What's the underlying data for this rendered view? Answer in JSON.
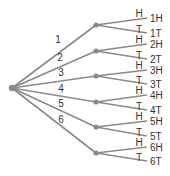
{
  "diagram": {
    "type": "tree",
    "colors": {
      "edge": "#8a8a8a",
      "text": "#333333"
    },
    "root": {
      "x": 12,
      "y": 88
    },
    "branches": [
      {
        "label": "1",
        "node": {
          "x": 96,
          "y": 25
        },
        "label_pos": {
          "x": 58,
          "y": 43
        },
        "leaves": [
          {
            "edge": "H",
            "outcome": "1H",
            "y": 18
          },
          {
            "edge": "T",
            "outcome": "1T",
            "y": 33
          }
        ]
      },
      {
        "label": "2",
        "node": {
          "x": 96,
          "y": 51
        },
        "label_pos": {
          "x": 60,
          "y": 61
        },
        "leaves": [
          {
            "edge": "H",
            "outcome": "2H",
            "y": 44
          },
          {
            "edge": "T",
            "outcome": "2T",
            "y": 59
          }
        ]
      },
      {
        "label": "3",
        "node": {
          "x": 96,
          "y": 76
        },
        "label_pos": {
          "x": 61,
          "y": 76
        },
        "leaves": [
          {
            "edge": "H",
            "outcome": "3H",
            "y": 70
          },
          {
            "edge": "T",
            "outcome": "3T",
            "y": 84
          }
        ]
      },
      {
        "label": "4",
        "node": {
          "x": 96,
          "y": 102
        },
        "label_pos": {
          "x": 61,
          "y": 92
        },
        "leaves": [
          {
            "edge": "H",
            "outcome": "4H",
            "y": 95
          },
          {
            "edge": "T",
            "outcome": "4T",
            "y": 110
          }
        ]
      },
      {
        "label": "5",
        "node": {
          "x": 96,
          "y": 127
        },
        "label_pos": {
          "x": 61,
          "y": 107
        },
        "leaves": [
          {
            "edge": "H",
            "outcome": "5H",
            "y": 121
          },
          {
            "edge": "T",
            "outcome": "5T",
            "y": 136
          }
        ]
      },
      {
        "label": "6",
        "node": {
          "x": 96,
          "y": 153
        },
        "label_pos": {
          "x": 61,
          "y": 123
        },
        "leaves": [
          {
            "edge": "H",
            "outcome": "6H",
            "y": 147
          },
          {
            "edge": "T",
            "outcome": "6T",
            "y": 161
          }
        ]
      }
    ]
  }
}
